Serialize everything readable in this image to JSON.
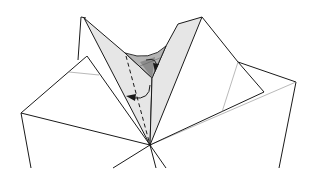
{
  "diagram": {
    "width": 311,
    "height": 178,
    "colors": {
      "background": "#ffffff",
      "paper_white": "#ffffff",
      "paper_light_gray": "#e6e6e6",
      "paper_mid_gray": "#b4b4b4",
      "paper_dark_gray": "#8c8c8c",
      "line": "#1a1a1a",
      "thin_line": "#8a8a8a"
    },
    "symbols": [
      {
        "name": "valley-fold-line",
        "style": "dashed",
        "description": "dashed vertical crease from center pocket to bottom vertex"
      },
      {
        "name": "fold-arrow-left",
        "style": "curved arrow with filled head",
        "description": "curved arrow pointing left across dashed crease"
      },
      {
        "name": "fold-arrow-right",
        "style": "curved arrow with filled head",
        "description": "small curved arrow inside the gray pocket"
      }
    ]
  }
}
